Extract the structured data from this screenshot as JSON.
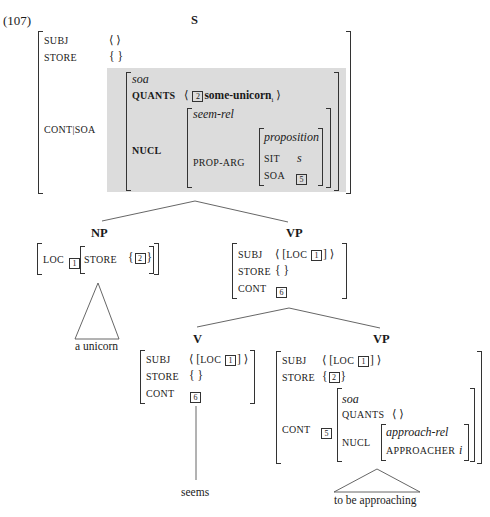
{
  "example_number": "(107)",
  "root": {
    "label": "S",
    "avm": {
      "subj_attr": "SUBJ",
      "subj_val": "⟨ ⟩",
      "store_attr": "STORE",
      "store_val": "{ }",
      "cont_attr": "CONT|SOA",
      "cont_tag": "6",
      "soa": {
        "type": "soa",
        "quants_attr": "QUANTS",
        "quants_open": "⟨",
        "quants_tag": "2",
        "quants_val": "some-unicorn",
        "quants_sub": "i",
        "quants_close": "⟩",
        "nucl_attr": "NUCL",
        "nucl": {
          "type": "seem-rel",
          "prop_arg_attr": "PROP-ARG",
          "prop": {
            "type": "proposition",
            "sit_attr": "SIT",
            "sit_val": "s",
            "soa_attr": "SOA",
            "soa_tag": "5"
          }
        }
      }
    }
  },
  "np": {
    "label": "NP",
    "loc_attr": "LOC",
    "loc_tag": "1",
    "store_attr": "STORE",
    "store_tag": "2",
    "leaf": "a unicorn"
  },
  "vp1": {
    "label": "VP",
    "subj_attr": "SUBJ",
    "subj_val": "LOC",
    "subj_tag": "1",
    "store_attr": "STORE",
    "store_val": "{ }",
    "cont_attr": "CONT",
    "cont_tag": "6"
  },
  "v": {
    "label": "V",
    "subj_attr": "SUBJ",
    "subj_val": "LOC",
    "subj_tag": "1",
    "store_attr": "STORE",
    "store_val": "{ }",
    "cont_attr": "CONT",
    "cont_tag": "6",
    "leaf": "seems"
  },
  "vp2": {
    "label": "VP",
    "subj_attr": "SUBJ",
    "subj_val": "LOC",
    "subj_tag": "1",
    "store_attr": "STORE",
    "store_tag": "2",
    "cont_attr": "CONT",
    "cont_tag": "5",
    "soa_type": "soa",
    "quants_attr": "QUANTS",
    "quants_val": "⟨ ⟩",
    "nucl_attr": "NUCL",
    "nucl_type": "approach-rel",
    "approacher_attr": "APPROACHER",
    "approacher_val": "i",
    "leaf": "to be approaching"
  }
}
